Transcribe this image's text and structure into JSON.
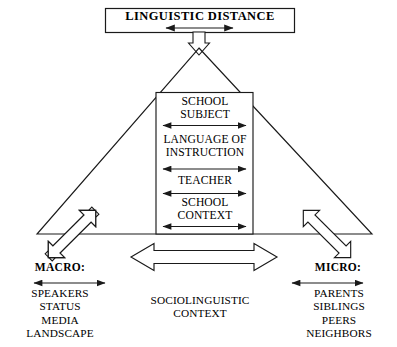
{
  "diagram": {
    "title": "LINGUISTIC DISTANCE",
    "center_column": {
      "items": [
        {
          "label": "SCHOOL\nSUBJECT",
          "arrow": "double-headed-horizontal-arrow"
        },
        {
          "label": "LANGUAGE OF\nINSTRUCTION",
          "arrow": "double-headed-horizontal-arrow"
        },
        {
          "label": "TEACHER",
          "arrow": "double-headed-horizontal-arrow"
        },
        {
          "label": "SCHOOL\nCONTEXT",
          "arrow": "double-headed-horizontal-arrow"
        }
      ]
    },
    "left_block": {
      "heading": "MACRO:",
      "items": "SPEAKERS\nSTATUS\nMEDIA\nLANDSCAPE"
    },
    "right_block": {
      "heading": "MICRO:",
      "items": "PARENTS\nSIBLINGS\nPEERS\nNEIGHBORS"
    },
    "bottom_center": {
      "label": "SOCIOLINGUISTIC\nCONTEXT"
    },
    "icons": {
      "apex_arrow": "hollow-down-arrow-icon",
      "left_diagonal_arrow": "hollow-diagonal-double-arrow-icon",
      "right_diagonal_arrow": "hollow-diagonal-double-arrow-icon",
      "bottom_wide_arrow": "hollow-horizontal-double-arrow-icon",
      "title_arrow": "thin-horizontal-double-arrow-icon"
    },
    "colors": {
      "stroke": "#1a1a1a",
      "background": "#ffffff",
      "text": "#000000"
    }
  }
}
